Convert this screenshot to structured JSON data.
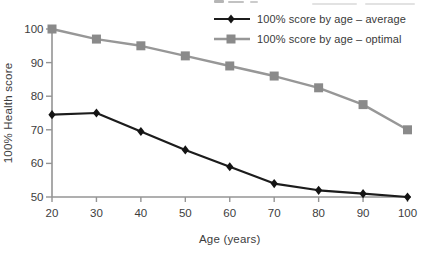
{
  "chart_data": {
    "type": "line",
    "title": "",
    "xlabel": "Age (years)",
    "ylabel": "100% Health score",
    "x": [
      20,
      30,
      40,
      50,
      60,
      70,
      80,
      90,
      100
    ],
    "x_ticks": [
      20,
      30,
      40,
      50,
      60,
      70,
      80,
      90,
      100
    ],
    "y_ticks": [
      50,
      60,
      70,
      80,
      90,
      100
    ],
    "xlim": [
      20,
      100
    ],
    "ylim": [
      50,
      100
    ],
    "grid": false,
    "legend_position": "top-right",
    "axis_color": "#949494",
    "text_color": "#3d3d3d",
    "series": [
      {
        "name": "100% score by age – average",
        "marker": "diamond",
        "line_color": "#1c1c1c",
        "marker_color": "#141414",
        "line_width": 2.2,
        "values": [
          74.5,
          75,
          69.5,
          64,
          59,
          54,
          52,
          51,
          50
        ]
      },
      {
        "name": "100% score by age – optimal",
        "marker": "square",
        "line_color": "#979797",
        "marker_color": "#8a8a8a",
        "line_width": 2.4,
        "values": [
          100,
          97,
          95,
          92,
          89,
          86,
          82.5,
          77.5,
          70
        ]
      }
    ]
  }
}
